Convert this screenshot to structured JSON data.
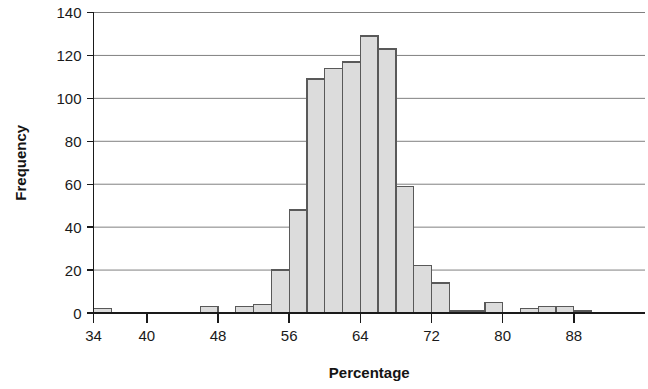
{
  "chart_data": {
    "type": "bar",
    "title": "",
    "subtitle": "",
    "xlabel": "Percentage",
    "ylabel": "Frequency",
    "grid": true,
    "legend": false,
    "legend_position": "none",
    "bin_width": 2,
    "xlim": [
      34,
      96
    ],
    "ylim": [
      0,
      140
    ],
    "xticks": [
      34,
      40,
      48,
      56,
      64,
      72,
      80,
      88
    ],
    "yticks": [
      0,
      20,
      40,
      60,
      80,
      100,
      120,
      140
    ],
    "bar_fill": "#dcdcdc",
    "bar_stroke": "#595959",
    "axis_color": "#1a1a1a",
    "grid_color": "#808080",
    "categories": [
      "34-36",
      "36-38",
      "38-40",
      "40-42",
      "42-44",
      "44-46",
      "46-48",
      "48-50",
      "50-52",
      "52-54",
      "54-56",
      "56-58",
      "58-60",
      "60-62",
      "62-64",
      "64-66",
      "66-68",
      "68-70",
      "70-72",
      "72-74",
      "74-76",
      "76-78",
      "78-80",
      "80-82",
      "82-84",
      "84-86",
      "86-88",
      "88-90",
      "90-92",
      "92-94",
      "94-96"
    ],
    "bin_starts": [
      34,
      36,
      38,
      40,
      42,
      44,
      46,
      48,
      50,
      52,
      54,
      56,
      58,
      60,
      62,
      64,
      66,
      68,
      70,
      72,
      74,
      76,
      78,
      80,
      82,
      84,
      86,
      88,
      90,
      92,
      94
    ],
    "values": [
      2,
      0,
      0,
      0,
      0,
      0,
      3,
      0,
      3,
      4,
      20,
      48,
      109,
      114,
      117,
      129,
      123,
      59,
      22,
      14,
      1,
      1,
      5,
      0,
      2,
      3,
      3,
      1,
      0,
      0,
      0
    ]
  },
  "axes": {
    "x_title": "Percentage",
    "y_title": "Frequency"
  }
}
